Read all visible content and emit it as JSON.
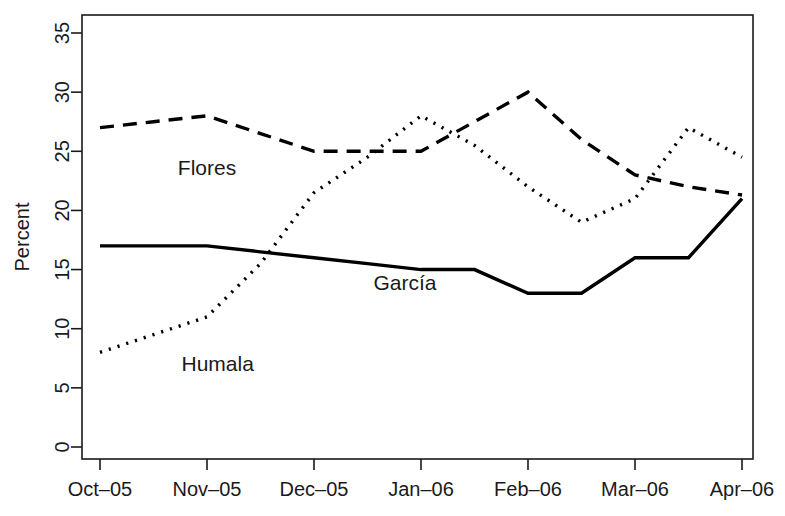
{
  "chart_data": {
    "type": "line",
    "title": "",
    "subtitle": "",
    "xlabel": "",
    "ylabel": "Percent",
    "xlim": [
      0,
      10
    ],
    "ylim": [
      0,
      36
    ],
    "grid": false,
    "legend_position": "inline-annotations",
    "x_tick_labels": [
      "Oct–05",
      "Nov–05",
      "Dec–05",
      "Jan–06",
      "Feb–06",
      "Mar–06",
      "Apr–06"
    ],
    "x_tick_values": [
      0,
      1,
      2,
      3,
      4,
      5,
      6
    ],
    "y_tick_labels": [
      "0",
      "5",
      "10",
      "15",
      "20",
      "25",
      "30",
      "35"
    ],
    "y_tick_values": [
      0,
      5,
      10,
      15,
      20,
      25,
      30,
      35
    ],
    "x": [
      0,
      0.5,
      1,
      1.5,
      2,
      2.5,
      3,
      3.5,
      4,
      4.5,
      5,
      5.5,
      6
    ],
    "series": [
      {
        "name": "Flores",
        "style": "dashed",
        "color": "#000000",
        "label_x": 1.0,
        "label_y": 23.0,
        "values": [
          27,
          27.5,
          28,
          26.5,
          25,
          25,
          25,
          27.5,
          30,
          26,
          23,
          22,
          21.3
        ]
      },
      {
        "name": "García",
        "style": "solid",
        "color": "#000000",
        "label_x": 2.85,
        "label_y": 13.3,
        "values": [
          17,
          17,
          17,
          16.5,
          16,
          15.5,
          15,
          15,
          13,
          13,
          16,
          16,
          21
        ]
      },
      {
        "name": "Humala",
        "style": "dotted",
        "color": "#000000",
        "label_x": 1.1,
        "label_y": 6.4,
        "values": [
          8,
          9.5,
          11,
          15.5,
          21.5,
          24.5,
          28,
          25.5,
          22,
          19,
          21,
          27,
          24.5
        ]
      }
    ],
    "annotations": [
      {
        "text": "Flores",
        "x": 1.0,
        "y": 23.0
      },
      {
        "text": "García",
        "x": 2.85,
        "y": 13.3
      },
      {
        "text": "Humala",
        "x": 1.1,
        "y": 6.4
      }
    ]
  }
}
